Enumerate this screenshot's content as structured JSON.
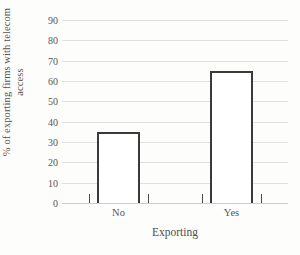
{
  "chart_data": {
    "type": "bar",
    "title": "",
    "subtitle": "",
    "categories": [
      "No",
      "Yes"
    ],
    "values": [
      35,
      65
    ],
    "xlabel": "Exporting",
    "ylabel": "% of exporting firms with telecom access",
    "ylabel_line1": "% of exporting firms with telecom",
    "ylabel_line2": "access",
    "ylim": [
      0,
      90
    ],
    "ytick_labels": [
      "0",
      "10",
      "20",
      "30",
      "40",
      "50",
      "60",
      "70",
      "80",
      "90"
    ],
    "ytick_values": [
      0,
      10,
      20,
      30,
      40,
      50,
      60,
      70,
      80,
      90
    ],
    "grid": true,
    "legend": false,
    "legend_position": "none",
    "series": [
      {
        "name": "% of exporting firms with telecom access",
        "values": [
          35,
          65
        ]
      }
    ],
    "bar_fill_color": "#ffffff",
    "bar_border_color": "#3a3a3a",
    "gridline_color": "#e3e1e0",
    "axis_color": "#cfcdcc",
    "text_color": "#575555",
    "background_color": "#fdfdfc"
  }
}
